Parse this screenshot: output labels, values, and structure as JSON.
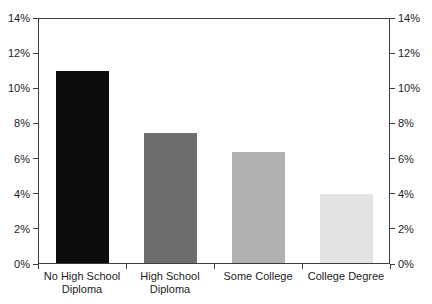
{
  "chart_data": {
    "type": "bar",
    "title": "",
    "xlabel": "",
    "ylabel": "",
    "categories": [
      "No High School Diploma",
      "High School Diploma",
      "Some College",
      "College Degree"
    ],
    "values": [
      10.9,
      7.4,
      6.3,
      3.9
    ],
    "unit": "%",
    "bar_colors": [
      "#0c0c0c",
      "#6e6e6e",
      "#b1b1b1",
      "#e3e3e3"
    ],
    "ylim": [
      0,
      14
    ],
    "ytick_step": 2,
    "ytick_labels_left": [
      "0%",
      "2%",
      "4%",
      "6%",
      "8%",
      "10%",
      "12%",
      "14%"
    ],
    "ytick_labels_right": [
      "0%",
      "2%",
      "4%",
      "6%",
      "8%",
      "10%",
      "12%",
      "14%"
    ],
    "dual_y_axis": true,
    "grid": false,
    "frame": true,
    "legend": "none",
    "axis_color": "#3d3d3d",
    "text_color": "#1c1c1c",
    "background_color": "#ffffff"
  }
}
